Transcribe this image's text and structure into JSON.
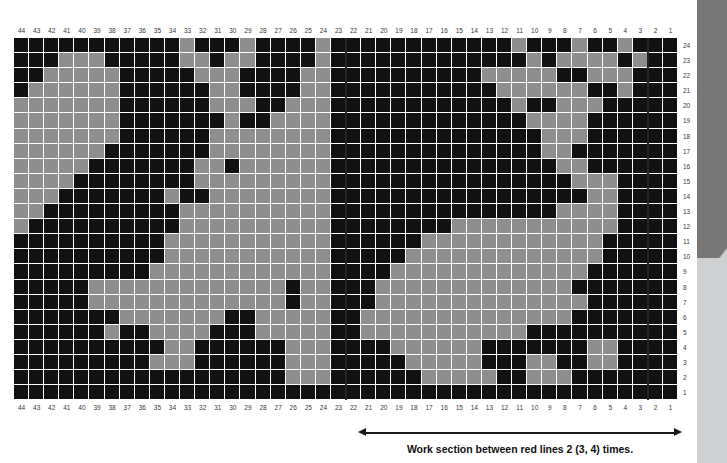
{
  "chart_data": {
    "type": "heatmap",
    "title": "",
    "subtitle": "",
    "xlabel": "",
    "ylabel": "",
    "grid": true,
    "legend_position": "none",
    "colors": {
      "knit": "#111111",
      "purl": "#8e8e8e",
      "grid_line": "#ffffff",
      "marker_line": "#242424"
    },
    "columns": 44,
    "rows": 24,
    "x_tick_labels": [
      44,
      43,
      42,
      41,
      40,
      39,
      38,
      37,
      36,
      35,
      34,
      33,
      32,
      31,
      30,
      29,
      28,
      27,
      26,
      25,
      24,
      23,
      22,
      21,
      20,
      19,
      18,
      17,
      16,
      15,
      14,
      13,
      12,
      11,
      10,
      9,
      8,
      7,
      6,
      5,
      4,
      3,
      2,
      1
    ],
    "y_tick_labels": [
      24,
      23,
      22,
      21,
      20,
      19,
      18,
      17,
      16,
      15,
      14,
      13,
      12,
      11,
      10,
      9,
      8,
      7,
      6,
      5,
      4,
      3,
      2,
      1
    ],
    "marker_lines_after_column_index": [
      22,
      42
    ],
    "cell_values_note": "1 = dark (knit) square, 0 = grey (purl) square; rows listed top (row 24) to bottom (row 1); columns listed left (44) to right (1)",
    "values": [
      [
        1,
        1,
        1,
        1,
        1,
        1,
        1,
        1,
        1,
        1,
        1,
        0,
        1,
        1,
        1,
        0,
        1,
        1,
        1,
        1,
        0,
        1,
        1,
        1,
        1,
        1,
        1,
        1,
        1,
        1,
        1,
        1,
        1,
        0,
        1,
        1,
        1,
        0,
        1,
        1,
        0,
        1,
        1,
        1
      ],
      [
        1,
        1,
        1,
        0,
        0,
        0,
        1,
        1,
        1,
        1,
        1,
        0,
        0,
        1,
        0,
        0,
        1,
        1,
        1,
        1,
        0,
        1,
        1,
        1,
        1,
        1,
        1,
        1,
        1,
        1,
        1,
        1,
        1,
        1,
        0,
        1,
        0,
        0,
        0,
        0,
        1,
        0,
        1,
        1
      ],
      [
        1,
        1,
        0,
        0,
        0,
        0,
        0,
        1,
        1,
        1,
        1,
        1,
        0,
        0,
        0,
        1,
        1,
        1,
        1,
        0,
        0,
        1,
        1,
        1,
        1,
        1,
        1,
        1,
        1,
        1,
        1,
        0,
        0,
        0,
        0,
        0,
        1,
        1,
        0,
        0,
        0,
        1,
        1,
        1
      ],
      [
        1,
        0,
        0,
        0,
        0,
        0,
        0,
        1,
        1,
        1,
        1,
        1,
        1,
        0,
        0,
        1,
        1,
        1,
        1,
        0,
        0,
        1,
        1,
        1,
        1,
        1,
        1,
        1,
        1,
        1,
        1,
        1,
        0,
        0,
        0,
        0,
        0,
        0,
        1,
        1,
        0,
        1,
        1,
        1
      ],
      [
        0,
        0,
        0,
        0,
        0,
        0,
        0,
        1,
        1,
        1,
        1,
        1,
        1,
        0,
        0,
        0,
        1,
        1,
        0,
        0,
        0,
        1,
        1,
        1,
        1,
        1,
        1,
        1,
        1,
        1,
        1,
        1,
        1,
        0,
        1,
        1,
        0,
        0,
        0,
        1,
        1,
        1,
        1,
        1
      ],
      [
        0,
        0,
        0,
        0,
        0,
        0,
        0,
        1,
        1,
        1,
        1,
        1,
        1,
        1,
        0,
        1,
        1,
        0,
        0,
        0,
        0,
        1,
        1,
        1,
        1,
        1,
        1,
        1,
        1,
        1,
        1,
        1,
        1,
        1,
        0,
        0,
        0,
        0,
        1,
        1,
        1,
        1,
        1,
        1
      ],
      [
        0,
        0,
        0,
        0,
        0,
        0,
        0,
        1,
        1,
        1,
        1,
        1,
        1,
        0,
        0,
        0,
        0,
        0,
        0,
        0,
        0,
        1,
        1,
        1,
        1,
        1,
        1,
        1,
        1,
        1,
        1,
        1,
        1,
        1,
        1,
        0,
        0,
        0,
        1,
        1,
        1,
        1,
        1,
        1
      ],
      [
        0,
        0,
        0,
        0,
        0,
        0,
        1,
        1,
        1,
        1,
        1,
        1,
        1,
        0,
        0,
        0,
        0,
        0,
        0,
        0,
        0,
        1,
        1,
        1,
        1,
        1,
        1,
        1,
        1,
        1,
        1,
        1,
        1,
        1,
        1,
        0,
        0,
        1,
        1,
        1,
        1,
        1,
        1,
        1
      ],
      [
        0,
        0,
        0,
        0,
        0,
        1,
        1,
        1,
        1,
        1,
        1,
        1,
        0,
        0,
        1,
        0,
        0,
        0,
        0,
        0,
        0,
        1,
        1,
        1,
        1,
        1,
        1,
        1,
        1,
        1,
        1,
        1,
        1,
        1,
        1,
        1,
        0,
        0,
        1,
        1,
        1,
        1,
        1,
        1
      ],
      [
        0,
        0,
        0,
        0,
        1,
        1,
        1,
        1,
        1,
        1,
        1,
        1,
        0,
        0,
        0,
        0,
        0,
        0,
        0,
        0,
        0,
        1,
        1,
        1,
        1,
        1,
        1,
        1,
        1,
        1,
        1,
        1,
        1,
        1,
        1,
        1,
        1,
        0,
        0,
        0,
        1,
        1,
        1,
        1
      ],
      [
        0,
        0,
        0,
        1,
        1,
        1,
        1,
        1,
        1,
        1,
        0,
        1,
        1,
        0,
        0,
        0,
        0,
        0,
        0,
        0,
        0,
        1,
        1,
        1,
        1,
        1,
        1,
        1,
        1,
        1,
        1,
        1,
        1,
        1,
        1,
        1,
        1,
        1,
        0,
        0,
        1,
        1,
        1,
        1
      ],
      [
        0,
        0,
        1,
        1,
        1,
        1,
        1,
        1,
        1,
        1,
        1,
        0,
        0,
        0,
        0,
        0,
        0,
        0,
        0,
        0,
        0,
        1,
        1,
        1,
        1,
        1,
        1,
        1,
        1,
        1,
        1,
        1,
        1,
        1,
        1,
        1,
        0,
        0,
        0,
        0,
        1,
        1,
        1,
        1
      ],
      [
        0,
        1,
        1,
        1,
        1,
        1,
        1,
        1,
        1,
        1,
        1,
        0,
        0,
        0,
        0,
        0,
        0,
        0,
        0,
        0,
        0,
        1,
        1,
        1,
        1,
        1,
        1,
        1,
        1,
        0,
        0,
        0,
        0,
        0,
        0,
        0,
        0,
        0,
        0,
        0,
        1,
        1,
        1,
        1
      ],
      [
        1,
        1,
        1,
        1,
        1,
        1,
        1,
        1,
        1,
        1,
        0,
        0,
        0,
        0,
        0,
        0,
        0,
        0,
        0,
        0,
        0,
        1,
        1,
        1,
        1,
        1,
        1,
        0,
        0,
        0,
        0,
        0,
        0,
        0,
        0,
        0,
        0,
        0,
        0,
        1,
        1,
        1,
        1,
        1
      ],
      [
        1,
        1,
        1,
        1,
        1,
        1,
        1,
        1,
        1,
        1,
        0,
        0,
        0,
        0,
        0,
        0,
        0,
        0,
        0,
        0,
        0,
        1,
        1,
        1,
        1,
        1,
        0,
        0,
        0,
        0,
        0,
        0,
        0,
        0,
        0,
        0,
        0,
        0,
        0,
        1,
        1,
        1,
        1,
        1
      ],
      [
        1,
        1,
        1,
        1,
        1,
        1,
        1,
        1,
        1,
        0,
        0,
        0,
        0,
        0,
        0,
        0,
        0,
        0,
        0,
        0,
        0,
        1,
        1,
        1,
        1,
        0,
        0,
        0,
        0,
        0,
        0,
        0,
        0,
        0,
        0,
        0,
        0,
        0,
        1,
        1,
        1,
        1,
        1,
        1
      ],
      [
        1,
        1,
        1,
        1,
        1,
        0,
        0,
        0,
        0,
        0,
        0,
        0,
        0,
        0,
        0,
        0,
        0,
        0,
        1,
        0,
        0,
        1,
        1,
        1,
        0,
        0,
        0,
        0,
        0,
        0,
        0,
        0,
        0,
        0,
        0,
        0,
        0,
        1,
        1,
        1,
        1,
        1,
        1,
        1
      ],
      [
        1,
        1,
        1,
        1,
        1,
        0,
        0,
        0,
        0,
        0,
        0,
        0,
        0,
        0,
        0,
        0,
        0,
        0,
        1,
        0,
        0,
        1,
        1,
        1,
        0,
        0,
        0,
        0,
        0,
        0,
        0,
        0,
        0,
        0,
        0,
        0,
        0,
        0,
        1,
        1,
        1,
        1,
        1,
        1
      ],
      [
        1,
        1,
        1,
        1,
        1,
        1,
        1,
        0,
        0,
        0,
        0,
        0,
        0,
        0,
        1,
        1,
        0,
        0,
        0,
        0,
        0,
        1,
        1,
        0,
        0,
        0,
        0,
        0,
        0,
        0,
        0,
        0,
        0,
        0,
        0,
        0,
        0,
        1,
        1,
        1,
        1,
        1,
        1,
        1
      ],
      [
        1,
        1,
        1,
        1,
        1,
        1,
        0,
        1,
        1,
        0,
        0,
        0,
        0,
        1,
        1,
        1,
        0,
        0,
        0,
        0,
        0,
        1,
        1,
        0,
        0,
        0,
        0,
        0,
        0,
        0,
        0,
        0,
        0,
        0,
        1,
        1,
        1,
        1,
        1,
        1,
        1,
        1,
        1,
        1
      ],
      [
        1,
        1,
        1,
        1,
        1,
        1,
        1,
        1,
        1,
        1,
        0,
        0,
        1,
        1,
        1,
        1,
        1,
        1,
        0,
        0,
        0,
        1,
        1,
        1,
        1,
        0,
        0,
        0,
        0,
        0,
        0,
        1,
        1,
        1,
        1,
        1,
        1,
        1,
        0,
        0,
        1,
        1,
        1,
        1
      ],
      [
        1,
        1,
        1,
        1,
        1,
        1,
        1,
        1,
        1,
        0,
        0,
        0,
        1,
        1,
        1,
        1,
        1,
        1,
        0,
        0,
        0,
        1,
        1,
        1,
        1,
        1,
        0,
        0,
        0,
        0,
        0,
        1,
        1,
        1,
        0,
        0,
        1,
        1,
        0,
        0,
        1,
        1,
        1,
        1
      ],
      [
        1,
        1,
        1,
        1,
        1,
        1,
        1,
        1,
        1,
        1,
        1,
        1,
        1,
        1,
        1,
        1,
        1,
        1,
        0,
        0,
        0,
        1,
        1,
        1,
        1,
        1,
        1,
        0,
        0,
        0,
        0,
        0,
        1,
        1,
        0,
        0,
        0,
        1,
        1,
        1,
        1,
        1,
        1,
        1
      ],
      [
        1,
        1,
        1,
        1,
        1,
        1,
        1,
        1,
        1,
        1,
        1,
        1,
        1,
        1,
        1,
        1,
        1,
        1,
        1,
        1,
        1,
        1,
        1,
        1,
        1,
        1,
        1,
        1,
        1,
        1,
        1,
        1,
        1,
        1,
        1,
        1,
        1,
        1,
        1,
        1,
        1,
        1,
        1,
        1
      ]
    ]
  },
  "caption": {
    "text": "Work section between red lines 2 (3, 4) times."
  },
  "arrow": {
    "left_head": "◀",
    "right_head": "▶"
  }
}
